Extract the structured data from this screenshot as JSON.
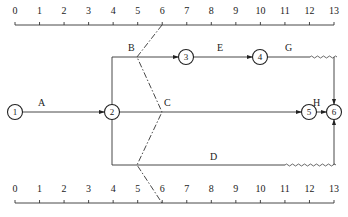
{
  "diagram": {
    "type": "time-scaled network diagram",
    "time_scale": {
      "ticks": [
        "0",
        "1",
        "2",
        "3",
        "4",
        "5",
        "6",
        "7",
        "8",
        "9",
        "10",
        "11",
        "12",
        "13"
      ],
      "top_scale_y": 25,
      "bottom_scale_y": 203
    },
    "nodes": [
      {
        "id": "1",
        "label": "1"
      },
      {
        "id": "2",
        "label": "2"
      },
      {
        "id": "3",
        "label": "3"
      },
      {
        "id": "4",
        "label": "4"
      },
      {
        "id": "5",
        "label": "5"
      },
      {
        "id": "6",
        "label": "6"
      }
    ],
    "activities": [
      {
        "name": "A",
        "label": "A",
        "from": "1",
        "to": "2",
        "start": 0,
        "end": 4,
        "free_float": 0
      },
      {
        "name": "B",
        "label": "B",
        "from": "2",
        "to": "3",
        "start": 4,
        "end": 7,
        "free_float": 0
      },
      {
        "name": "C",
        "label": "C",
        "from": "2",
        "to": "5",
        "start": 4,
        "end": 12,
        "free_float": 0
      },
      {
        "name": "D",
        "label": "D",
        "from": "2",
        "to": "6",
        "start": 4,
        "end": 11,
        "free_float": 2
      },
      {
        "name": "E",
        "label": "E",
        "from": "3",
        "to": "4",
        "start": 7,
        "end": 10,
        "free_float": 0
      },
      {
        "name": "G",
        "label": "G",
        "from": "4",
        "to": "6",
        "start": 10,
        "end": 12,
        "free_float": 1
      },
      {
        "name": "H",
        "label": "H",
        "from": "5",
        "to": "6",
        "start": 12,
        "end": 13,
        "free_float": 0
      }
    ],
    "progress_check_line": {
      "style": "dash-dot",
      "time_at_check": 6,
      "points": [
        "top scale at 6",
        "B at 5",
        "C at 6",
        "D at 5",
        "bottom scale at 6"
      ]
    },
    "colors": {
      "line": "#333333",
      "background": "#ffffff",
      "text": "#222222"
    }
  }
}
